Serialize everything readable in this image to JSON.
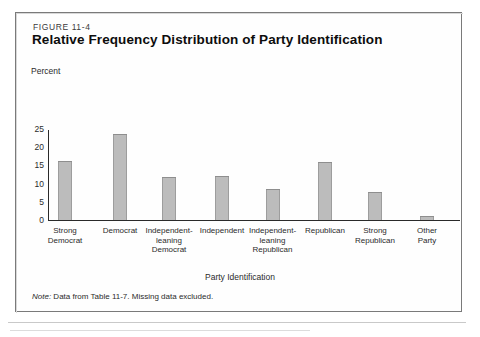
{
  "figure": {
    "number": "FIGURE 11-4",
    "title": "Relative Frequency Distribution of Party Identification",
    "note_prefix": "Note:",
    "note_text": " Data from Table 11-7. Missing data excluded."
  },
  "chart_data": {
    "type": "bar",
    "title": "Relative Frequency Distribution of Party Identification",
    "xlabel": "Party Identification",
    "ylabel": "Percent",
    "ylim": [
      0,
      25
    ],
    "yticks": [
      "0",
      "5",
      "10",
      "15",
      "20",
      "25"
    ],
    "grid": false,
    "legend": "none",
    "bar_color": "#bcbcbc",
    "bar_edge_color": "#8e8e8e",
    "categories": [
      "Strong Democrat",
      "Democrat",
      "Independent-leaning Democrat",
      "Independent",
      "Independent-leaning Republican",
      "Republican",
      "Strong Republican",
      "Other Party"
    ],
    "category_lines": [
      [
        "Strong",
        "Democrat"
      ],
      [
        "Democrat"
      ],
      [
        "Independent-",
        "leaning",
        "Democrat"
      ],
      [
        "Independent"
      ],
      [
        "Independent-",
        "leaning",
        "Republican"
      ],
      [
        "Republican"
      ],
      [
        "Strong",
        "Republican"
      ],
      [
        "Other",
        "Party"
      ]
    ],
    "values": [
      16.3,
      23.7,
      11.7,
      12.0,
      8.5,
      15.9,
      7.8,
      1.0
    ],
    "annotation": "Note: Data from Table 11-7. Missing data excluded."
  }
}
